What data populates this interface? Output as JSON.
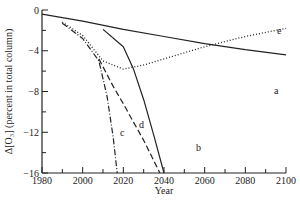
{
  "chart_data": {
    "type": "line",
    "title": "",
    "xlabel": "Year",
    "ylabel": "Δ[O₃] (percent in total column)",
    "xlim": [
      1980,
      2100
    ],
    "ylim": [
      -16,
      0
    ],
    "xticks_major": [
      1980,
      2000,
      2020,
      2040,
      2060,
      2080,
      2100
    ],
    "xticks_minor": [
      1990,
      2010,
      2030,
      2050,
      2070,
      2090
    ],
    "yticks_major": [
      0,
      -4,
      -8,
      -12,
      -16
    ],
    "yticks_minor": [
      -2,
      -6,
      -10,
      -14
    ],
    "grid": false,
    "legend": "inline curve letters",
    "series": [
      {
        "name": "a",
        "style": "solid",
        "x": [
          1980,
          2000,
          2020,
          2040,
          2060,
          2080,
          2100
        ],
        "values": [
          -0.4,
          -1.1,
          -1.9,
          -2.6,
          -3.3,
          -3.9,
          -4.4
        ]
      },
      {
        "name": "b",
        "style": "solid",
        "x": [
          2010,
          2020,
          2025,
          2030,
          2035,
          2040
        ],
        "values": [
          -1.9,
          -3.6,
          -5.8,
          -8.8,
          -12.3,
          -16
        ]
      },
      {
        "name": "c",
        "style": "dash-dot",
        "x": [
          1990,
          2000,
          2008,
          2012,
          2015,
          2017
        ],
        "values": [
          -1.3,
          -2.8,
          -5.0,
          -8.5,
          -12.5,
          -16
        ]
      },
      {
        "name": "d",
        "style": "dashed",
        "x": [
          2008,
          2015,
          2020,
          2025,
          2030,
          2038
        ],
        "values": [
          -4.8,
          -7.5,
          -9.2,
          -11.0,
          -12.8,
          -16
        ]
      },
      {
        "name": "e",
        "style": "dotted",
        "x": [
          1990,
          2000,
          2010,
          2020,
          2030,
          2040,
          2060,
          2080,
          2100
        ],
        "values": [
          -1.2,
          -2.5,
          -5.0,
          -5.8,
          -5.4,
          -4.8,
          -3.6,
          -2.6,
          -1.8
        ]
      }
    ]
  }
}
